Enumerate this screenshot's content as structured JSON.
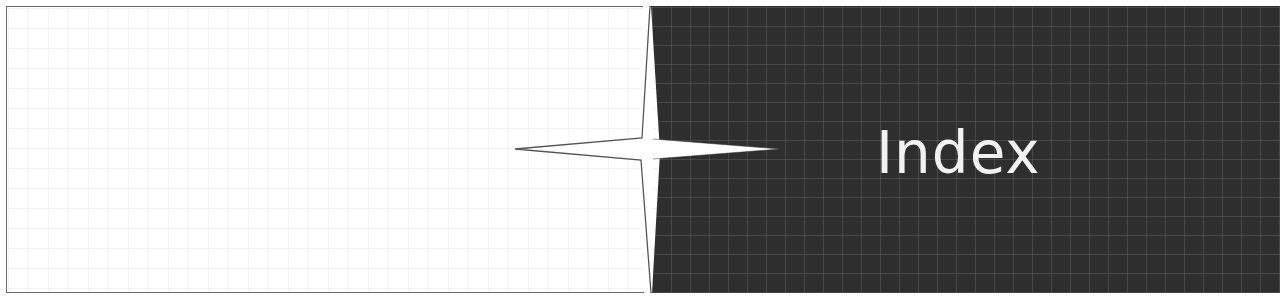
{
  "header": {
    "title": "Index"
  },
  "decoration": {
    "star_icon": "four-point-star",
    "grid_panel": "dark-grid-panel"
  },
  "colors": {
    "panel_dark": "#2e2e2e",
    "grid_line": "#6e6e6e",
    "title_text": "#f2f2f2",
    "frame_border": "#6a6a6a"
  }
}
